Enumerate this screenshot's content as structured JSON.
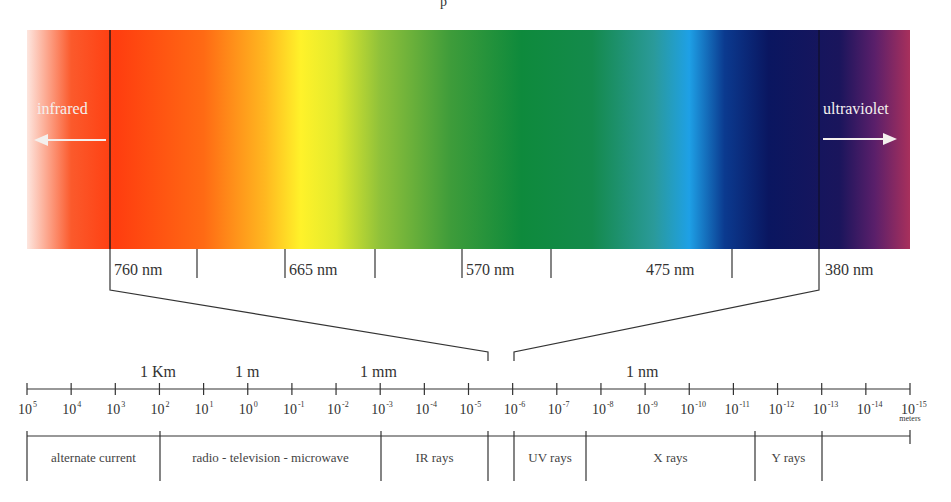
{
  "title_fragment": "p",
  "spectrum": {
    "left_label": "infrared",
    "right_label": "ultraviolet",
    "gradient_stops": [
      {
        "offset": 0.0,
        "color": "#fde6df"
      },
      {
        "offset": 0.05,
        "color": "#fb5a2c"
      },
      {
        "offset": 0.1,
        "color": "#ff3d0f"
      },
      {
        "offset": 0.2,
        "color": "#ff6a14"
      },
      {
        "offset": 0.27,
        "color": "#ffb820"
      },
      {
        "offset": 0.31,
        "color": "#fff22a"
      },
      {
        "offset": 0.35,
        "color": "#e2ea2d"
      },
      {
        "offset": 0.4,
        "color": "#8fc13a"
      },
      {
        "offset": 0.48,
        "color": "#3e9c3a"
      },
      {
        "offset": 0.56,
        "color": "#0e8a3c"
      },
      {
        "offset": 0.64,
        "color": "#148a4c"
      },
      {
        "offset": 0.71,
        "color": "#2a9a9a"
      },
      {
        "offset": 0.75,
        "color": "#1ea0e6"
      },
      {
        "offset": 0.79,
        "color": "#0b3a8f"
      },
      {
        "offset": 0.84,
        "color": "#0a1660"
      },
      {
        "offset": 0.92,
        "color": "#1a155c"
      },
      {
        "offset": 0.96,
        "color": "#5a1f6a"
      },
      {
        "offset": 1.0,
        "color": "#a8305c"
      }
    ],
    "wavelength_labels": [
      "760 nm",
      "665 nm",
      "570 nm",
      "475 nm",
      "380 nm"
    ]
  },
  "scale": {
    "unit_labels": [
      "1 Km",
      "1 m",
      "1 mm",
      "1 nm"
    ],
    "base": "10",
    "exponents": [
      "5",
      "4",
      "3",
      "2",
      "1",
      "0",
      "-1",
      "-2",
      "-3",
      "-4",
      "-5",
      "-6",
      "-7",
      "-8",
      "-9",
      "-10",
      "-11",
      "-12",
      "-13",
      "-14",
      "-15"
    ],
    "unit_suffix": "meters"
  },
  "bands": [
    {
      "label": "alternate current"
    },
    {
      "label": "radio - television - microwave"
    },
    {
      "label": "IR rays"
    },
    {
      "label": ""
    },
    {
      "label": "UV rays"
    },
    {
      "label": "X rays"
    },
    {
      "label": "Y rays"
    },
    {
      "label": ""
    }
  ],
  "colors": {
    "line": "#333333",
    "text": "#333333",
    "background": "#ffffff"
  }
}
